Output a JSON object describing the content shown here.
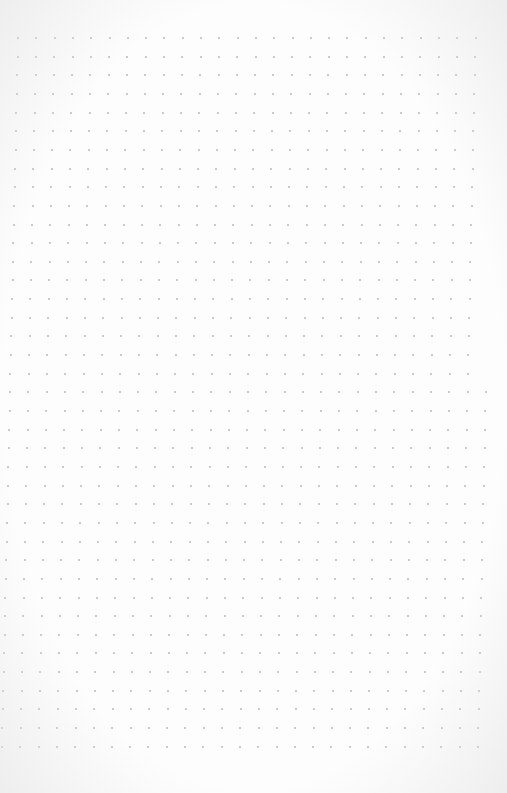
{
  "page": {
    "type": "dot-grid-notebook-page",
    "background_color": "#fdfdfd",
    "dot_color": "#b9b9b9",
    "dot_size_px": 2
  },
  "grid": {
    "top_row_y": 38,
    "row_spacing": 18.65,
    "rows": 39,
    "top_row": {
      "first_x": 18,
      "col_spacing": 18.3,
      "cols": 26
    },
    "bottom_row": {
      "first_x": 2,
      "col_spacing": 18.3,
      "cols": 27
    }
  }
}
